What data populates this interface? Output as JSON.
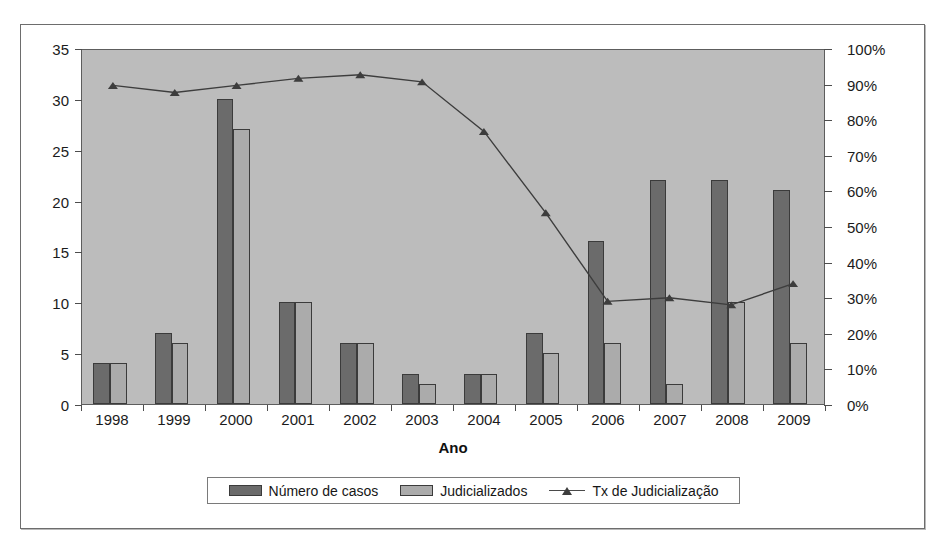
{
  "chart_data": {
    "type": "bar",
    "title": "",
    "xlabel": "Ano",
    "ylabel": "",
    "categories": [
      "1998",
      "1999",
      "2000",
      "2001",
      "2002",
      "2003",
      "2004",
      "2005",
      "2006",
      "2007",
      "2008",
      "2009"
    ],
    "series": [
      {
        "name": "Número de casos",
        "type": "bar",
        "axis": "left",
        "color": "#6b6b6b",
        "values": [
          4,
          7,
          30,
          10,
          6,
          3,
          3,
          7,
          16,
          22,
          22,
          21
        ]
      },
      {
        "name": "Judicializados",
        "type": "bar",
        "axis": "left",
        "color": "#ababab",
        "values": [
          4,
          6,
          27,
          10,
          6,
          2,
          3,
          5,
          6,
          2,
          10,
          6
        ]
      },
      {
        "name": "Tx de Judicialização",
        "type": "line",
        "axis": "right",
        "color": "#3d3d3d",
        "values": [
          90,
          88,
          90,
          92,
          93,
          91,
          77,
          54,
          29,
          30,
          28,
          34
        ]
      }
    ],
    "ylim": [
      0,
      35
    ],
    "yticks": [
      "0",
      "5",
      "10",
      "15",
      "20",
      "25",
      "30",
      "35"
    ],
    "y2lim": [
      0,
      100
    ],
    "y2ticks": [
      "0%",
      "10%",
      "20%",
      "30%",
      "40%",
      "50%",
      "60%",
      "70%",
      "80%",
      "90%",
      "100%"
    ],
    "grid": false,
    "legend_position": "bottom",
    "plot_background": "#bcbcbc"
  },
  "axes": {
    "left_ticks": [
      "35",
      "30",
      "25",
      "20",
      "15",
      "10",
      "5",
      "0"
    ],
    "right_ticks": [
      "100%",
      "90%",
      "80%",
      "70%",
      "60%",
      "50%",
      "40%",
      "30%",
      "20%",
      "10%",
      "0%"
    ],
    "x_labels": [
      "1998",
      "1999",
      "2000",
      "2001",
      "2002",
      "2003",
      "2004",
      "2005",
      "2006",
      "2007",
      "2008",
      "2009"
    ],
    "x_title": "Ano"
  },
  "legend": {
    "items": [
      {
        "label": "Número de casos",
        "marker": "swatch-dark"
      },
      {
        "label": "Judicializados",
        "marker": "swatch-light"
      },
      {
        "label": "Tx de Judicialização",
        "marker": "line-triangle"
      }
    ]
  }
}
